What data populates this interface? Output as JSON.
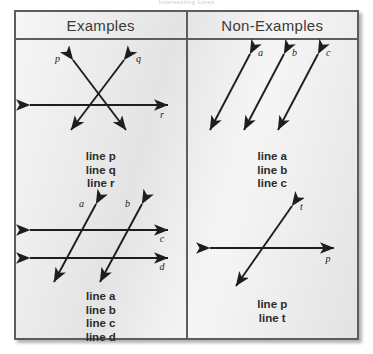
{
  "title": "Intersecting Lines",
  "card": {
    "border_color": "#5d5d5d",
    "background_color": "#ececed",
    "ink_color": "#1e1e1e"
  },
  "header": {
    "examples_label": "Examples",
    "non_examples_label": "Non-Examples"
  },
  "columns": {
    "examples": {
      "figures": [
        {
          "name": "two-lines-crossing-a-transversal",
          "line_labels": [
            "p",
            "q",
            "r"
          ],
          "caption": [
            "line p",
            "line q",
            "line r"
          ]
        },
        {
          "name": "two-parallel-lines-crossing-two-parallel-lines",
          "line_labels": [
            "a",
            "b",
            "c",
            "d"
          ],
          "caption": [
            "line a",
            "line b",
            "line c",
            "line d"
          ]
        }
      ]
    },
    "non_examples": {
      "figures": [
        {
          "name": "three-parallel-lines",
          "line_labels": [
            "a",
            "b",
            "c"
          ],
          "caption": [
            "line a",
            "line b",
            "line c"
          ]
        },
        {
          "name": "single-crossing-pair",
          "line_labels": [
            "t",
            "p"
          ],
          "caption": [
            "line p",
            "line t"
          ]
        }
      ]
    }
  }
}
